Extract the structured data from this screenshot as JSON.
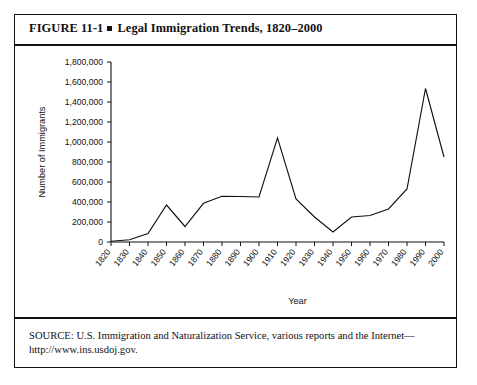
{
  "figure": {
    "label": "FIGURE  11-1",
    "title": "Legal Immigration Trends, 1820–2000",
    "source_line1": "SOURCE: U.S. Immigration and Naturalization Service, various reports and the Internet—",
    "source_line2": "http://www.ins.usdoj.gov."
  },
  "chart_data": {
    "type": "line",
    "title": "Legal Immigration Trends, 1820–2000",
    "xlabel": "Year",
    "ylabel": "Number of Immigrants",
    "categories": [
      "1820",
      "1830",
      "1840",
      "1850",
      "1860",
      "1870",
      "1880",
      "1890",
      "1900",
      "1910",
      "1920",
      "1930",
      "1940",
      "1950",
      "1960",
      "1970",
      "1980",
      "1990",
      "2000"
    ],
    "values": [
      8000,
      23000,
      84000,
      370000,
      155000,
      387000,
      457000,
      455000,
      450000,
      1041000,
      430000,
      250000,
      100000,
      250000,
      265000,
      330000,
      530000,
      1535000,
      850000
    ],
    "ylim": [
      0,
      1800000
    ],
    "ytick_values": [
      0,
      200000,
      400000,
      600000,
      800000,
      1000000,
      1200000,
      1400000,
      1600000,
      1800000
    ],
    "ytick_labels": [
      "0",
      "200,000",
      "400,000",
      "600,000",
      "800,000",
      "1,000,000",
      "1,200,000",
      "1,400,000",
      "1,600,000",
      "1,800,000"
    ],
    "grid": false,
    "legend": null,
    "line_color": "#111111"
  }
}
